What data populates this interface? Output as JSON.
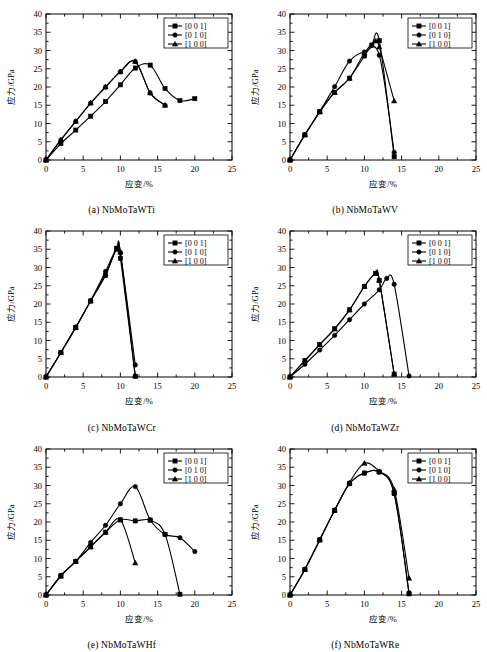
{
  "figure": {
    "axis": {
      "xlabel": "应变/%",
      "ylabel": "应力/GPa",
      "xlim": [
        0,
        25
      ],
      "ylim": [
        0,
        40
      ],
      "xticks": [
        0,
        5,
        10,
        15,
        20,
        25
      ],
      "yticks": [
        0,
        5,
        10,
        15,
        20,
        25,
        30,
        35,
        40
      ],
      "xtick_labels": [
        "0",
        "5",
        "10",
        "15",
        "20",
        "25"
      ],
      "ytick_labels": [
        "0",
        "5",
        "10",
        "15",
        "20",
        "25",
        "30",
        "35",
        "40"
      ],
      "grid": false,
      "legend_position": "top-right"
    },
    "legend": [
      {
        "label": "[0 0 1]",
        "marker": "square"
      },
      {
        "label": "[0 1 0]",
        "marker": "circle"
      },
      {
        "label": "[1 0 0]",
        "marker": "triangle"
      }
    ]
  },
  "chart_data": [
    {
      "type": "line",
      "panel": "a",
      "caption": "(a)  NbMoTaWTi",
      "title": "NbMoTaWTi",
      "xlabel": "应变/%",
      "ylabel": "应力/GPa",
      "xlim": [
        0,
        25
      ],
      "ylim": [
        0,
        40
      ],
      "series": [
        {
          "name": "[0 0 1]",
          "marker": "square",
          "x": [
            0,
            2,
            4,
            6,
            8,
            10,
            12,
            14,
            16,
            18,
            20
          ],
          "y": [
            0,
            4.5,
            8.2,
            12.0,
            16.0,
            20.6,
            25.2,
            26.0,
            19.6,
            16.3,
            16.8
          ]
        },
        {
          "name": "[0 1 0]",
          "marker": "circle",
          "x": [
            0,
            2,
            4,
            6,
            8,
            10,
            12,
            14,
            16
          ],
          "y": [
            0,
            5.5,
            10.6,
            15.6,
            20.0,
            24.2,
            27.0,
            18.4,
            15.0
          ]
        },
        {
          "name": "[1 0 0]",
          "marker": "triangle",
          "x": [
            0,
            2,
            4,
            6,
            8,
            10,
            12,
            14,
            16
          ],
          "y": [
            0,
            5.5,
            10.6,
            15.6,
            20.0,
            24.2,
            27.0,
            18.4,
            15.0
          ]
        }
      ]
    },
    {
      "type": "line",
      "panel": "b",
      "caption": "(b)  NbMoTaWV",
      "title": "NbMoTaWV",
      "xlabel": "应变/%",
      "ylabel": "应力/GPa",
      "xlim": [
        0,
        25
      ],
      "ylim": [
        0,
        40
      ],
      "series": [
        {
          "name": "[0 0 1]",
          "marker": "square",
          "x": [
            0,
            2,
            4,
            6,
            8,
            10,
            11,
            12,
            14
          ],
          "y": [
            0,
            6.9,
            13.2,
            18.5,
            22.4,
            28.5,
            31.5,
            32.7,
            0.9
          ]
        },
        {
          "name": "[0 1 0]",
          "marker": "circle",
          "x": [
            0,
            2,
            4,
            6,
            8,
            10,
            12,
            14
          ],
          "y": [
            0,
            6.9,
            13.3,
            20.1,
            27.1,
            29.6,
            28.7,
            2.1
          ]
        },
        {
          "name": "[1 0 0]",
          "marker": "triangle",
          "x": [
            0,
            2,
            4,
            6,
            8,
            10,
            11.5,
            12,
            14
          ],
          "y": [
            0,
            6.9,
            13.2,
            18.5,
            22.4,
            29.3,
            32.6,
            31.0,
            16.2
          ]
        }
      ]
    },
    {
      "type": "line",
      "panel": "c",
      "caption": "(c)  NbMoTaWCr",
      "title": "NbMoTaWCr",
      "xlabel": "应变/%",
      "ylabel": "应力/GPa",
      "xlim": [
        0,
        25
      ],
      "ylim": [
        0,
        40
      ],
      "series": [
        {
          "name": "[0 0 1]",
          "marker": "square",
          "x": [
            0,
            2,
            4,
            6,
            8,
            9.5,
            10,
            12
          ],
          "y": [
            0,
            6.7,
            13.5,
            20.8,
            27.8,
            35.2,
            32.5,
            0.2
          ]
        },
        {
          "name": "[0 1 0]",
          "marker": "circle",
          "x": [
            0,
            2,
            4,
            6,
            8,
            9.5,
            10,
            12
          ],
          "y": [
            0,
            6.7,
            13.7,
            20.9,
            28.9,
            35.3,
            34.1,
            3.3
          ]
        },
        {
          "name": "[1 0 0]",
          "marker": "triangle",
          "x": [
            0,
            2,
            4,
            6,
            8,
            9.5,
            10,
            12
          ],
          "y": [
            0,
            6.7,
            13.6,
            20.9,
            28.2,
            35.0,
            34.2,
            0.3
          ]
        }
      ]
    },
    {
      "type": "line",
      "panel": "d",
      "caption": "(d)  NbMoTaWZr",
      "title": "NbMoTaWZr",
      "xlabel": "应变/%",
      "ylabel": "应力/GPa",
      "xlim": [
        0,
        25
      ],
      "ylim": [
        0,
        40
      ],
      "series": [
        {
          "name": "[0 0 1]",
          "marker": "square",
          "x": [
            0,
            2,
            4,
            6,
            8,
            10,
            11.5,
            12,
            14
          ],
          "y": [
            0,
            4.5,
            8.9,
            13.2,
            18.4,
            24.8,
            28.4,
            26.5,
            0.8
          ]
        },
        {
          "name": "[0 1 0]",
          "marker": "circle",
          "x": [
            0,
            2,
            4,
            6,
            8,
            10,
            12,
            13,
            14,
            16
          ],
          "y": [
            0,
            3.5,
            7.4,
            11.4,
            15.7,
            20.0,
            23.9,
            27.0,
            25.4,
            0.3
          ]
        },
        {
          "name": "[1 0 0]",
          "marker": "triangle",
          "x": [
            0,
            2,
            4,
            6,
            8,
            10,
            11.5,
            12,
            14
          ],
          "y": [
            0,
            4.5,
            8.9,
            13.2,
            18.4,
            24.8,
            28.4,
            26.5,
            0.8
          ]
        }
      ]
    },
    {
      "type": "line",
      "panel": "e",
      "caption": "(e)  NbMoTaWHf",
      "title": "NbMoTaWHf",
      "xlabel": "应变/%",
      "ylabel": "应力/GPa",
      "xlim": [
        0,
        25
      ],
      "ylim": [
        0,
        40
      ],
      "series": [
        {
          "name": "[0 0 1]",
          "marker": "square",
          "x": [
            0,
            2,
            4,
            6,
            8,
            10,
            12,
            14,
            16,
            18
          ],
          "y": [
            0,
            5.2,
            9.2,
            13.2,
            17.2,
            20.6,
            20.3,
            20.5,
            16.6,
            0.2
          ]
        },
        {
          "name": "[0 1 0]",
          "marker": "circle",
          "x": [
            0,
            2,
            4,
            6,
            8,
            10,
            12,
            14,
            16,
            18,
            20
          ],
          "y": [
            0,
            5.4,
            9.2,
            14.4,
            19.1,
            25.0,
            29.7,
            20.6,
            16.6,
            15.7,
            11.9
          ]
        },
        {
          "name": "[1 0 0]",
          "marker": "triangle",
          "x": [
            0,
            2,
            4,
            6,
            8,
            10,
            12
          ],
          "y": [
            0,
            5.2,
            9.2,
            13.2,
            17.2,
            20.6,
            8.8
          ]
        }
      ]
    },
    {
      "type": "line",
      "panel": "f",
      "caption": "(f)  NbMoTaWRe",
      "title": "NbMoTaWRe",
      "xlabel": "应变/%",
      "ylabel": "应力/GPa",
      "xlim": [
        0,
        25
      ],
      "ylim": [
        0,
        40
      ],
      "series": [
        {
          "name": "[0 0 1]",
          "marker": "square",
          "x": [
            0,
            2,
            4,
            6,
            8,
            10,
            12,
            14,
            16
          ],
          "y": [
            0,
            7.0,
            15.1,
            23.2,
            30.5,
            33.4,
            33.7,
            27.8,
            0.3
          ]
        },
        {
          "name": "[0 1 0]",
          "marker": "circle",
          "x": [
            0,
            2,
            4,
            6,
            8,
            10,
            12,
            14,
            16
          ],
          "y": [
            0,
            7.0,
            15.1,
            23.2,
            30.5,
            33.4,
            33.7,
            27.8,
            0.6
          ]
        },
        {
          "name": "[1 0 0]",
          "marker": "triangle",
          "x": [
            0,
            2,
            4,
            6,
            8,
            10,
            12,
            14,
            16
          ],
          "y": [
            0,
            7.0,
            15.1,
            23.2,
            30.8,
            36.1,
            33.9,
            28.9,
            4.6
          ]
        }
      ]
    }
  ]
}
